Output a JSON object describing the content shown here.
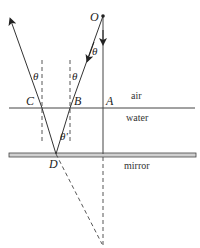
{
  "diagram": {
    "points": {
      "O": "O",
      "A": "A",
      "B": "B",
      "C": "C",
      "D": "D"
    },
    "angles": {
      "theta_at_O": "θ",
      "theta_at_B": "θ",
      "theta_at_C": "θ",
      "theta_prime_at_D": "θ'"
    },
    "media": {
      "upper": "air",
      "lower": "water",
      "bottom": "mirror"
    },
    "colors": {
      "line": "#333333",
      "mirror_fill": "#cfcfcf"
    }
  }
}
